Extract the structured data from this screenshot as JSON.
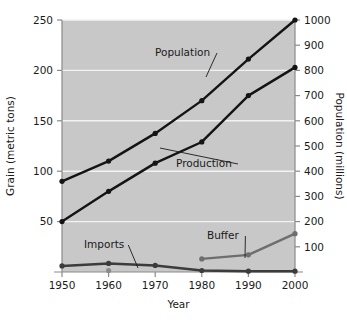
{
  "chart_data": {
    "type": "line",
    "title": "",
    "xlabel": "Year",
    "ylabel": "Grain (metric tons)",
    "y2label": "Population (millions)",
    "x": [
      1950,
      1960,
      1970,
      1980,
      1990,
      2000
    ],
    "xlim": [
      1945,
      2005
    ],
    "ylim": [
      0,
      250
    ],
    "y2lim": [
      0,
      1000
    ],
    "xticks": [
      "1950",
      "1960",
      "1970",
      "1980",
      "1990",
      "2000"
    ],
    "yticks": [
      "50",
      "100",
      "150",
      "200",
      "250"
    ],
    "y2ticks": [
      "100",
      "200",
      "300",
      "400",
      "500",
      "600",
      "700",
      "800",
      "900",
      "1000"
    ],
    "ytick_values": [
      50,
      100,
      150,
      200,
      250
    ],
    "y2tick_values": [
      100,
      200,
      300,
      400,
      500,
      600,
      700,
      800,
      900,
      1000
    ],
    "grid": true,
    "grid_color": "#f2f2f2",
    "plot_bgcolor": "#c8c8c8",
    "legend_position": "inline-annotations",
    "series": [
      {
        "name": "Population",
        "axis": "right",
        "units": "millions",
        "color": "#141414",
        "marker": "circle",
        "x": [
          1950,
          1960,
          1970,
          1980,
          1990,
          2000
        ],
        "values": [
          360,
          440,
          550,
          680,
          845,
          1000
        ],
        "values_on_left_scale": [
          90,
          110,
          137.5,
          170,
          211,
          250
        ]
      },
      {
        "name": "Production",
        "axis": "left",
        "units": "metric tons",
        "color": "#141414",
        "marker": "circle",
        "x": [
          1950,
          1960,
          1970,
          1980,
          1990,
          2000
        ],
        "values": [
          50,
          80,
          108,
          129,
          175,
          203
        ]
      },
      {
        "name": "Imports",
        "axis": "left",
        "units": "metric tons",
        "color": "#3c3c3c",
        "marker": "circle",
        "x": [
          1950,
          1960,
          1970,
          1980,
          1990,
          2000
        ],
        "values": [
          6,
          8.5,
          6.5,
          1.5,
          0.8,
          0.8
        ]
      },
      {
        "name": "Buffer",
        "axis": "left",
        "units": "metric tons",
        "color": "#6e6e6e",
        "marker": "circle",
        "x": [
          1980,
          1990,
          2000
        ],
        "values": [
          13,
          17,
          38
        ]
      }
    ],
    "annotations": [
      {
        "text": "Population",
        "label_x": 155,
        "label_y": 56,
        "leader_to_x": 206,
        "leader_to_y": 77
      },
      {
        "text": "Production",
        "label_x": 176,
        "label_y": 167,
        "leader_to_x": 160,
        "leader_to_y": 148
      },
      {
        "text": "Imports",
        "label_x": 84,
        "label_y": 248,
        "leader_to_x": 138,
        "leader_to_y": 268
      },
      {
        "text": "Buffer",
        "label_x": 207,
        "label_y": 239,
        "leader_to_x": 245,
        "leader_to_y": 258
      }
    ],
    "extra_points": [
      {
        "name": "imports-1960-gray-marker",
        "x": 1960,
        "value": 1.5,
        "color": "#8c8c8c"
      }
    ]
  }
}
